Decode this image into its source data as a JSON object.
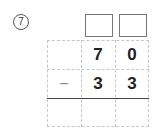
{
  "problem": {
    "number_label": "⑦",
    "number": "7",
    "answer_boxes": [
      "",
      ""
    ],
    "rows": [
      {
        "op": "",
        "tens": "7",
        "ones": "0"
      },
      {
        "op": "−",
        "tens": "3",
        "ones": "3"
      },
      {
        "op": "",
        "tens": "",
        "ones": ""
      }
    ]
  }
}
